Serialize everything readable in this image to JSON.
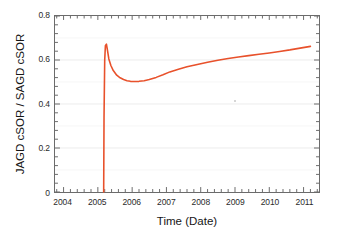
{
  "chart_data": {
    "type": "line",
    "title": "",
    "xlabel": "Time (Date)",
    "ylabel": "JAGD cSOR / SAGD cSOR",
    "xlim": [
      2003.75,
      2011.45
    ],
    "ylim": [
      0,
      0.8
    ],
    "grid": true,
    "legend": null,
    "line_color": "#e8512b",
    "axis_color": "#6b6b6b",
    "grid_color": "#ececec",
    "xticks": [
      2004,
      2005,
      2006,
      2007,
      2008,
      2009,
      2010,
      2011
    ],
    "xtick_labels": [
      "2004",
      "2005",
      "2006",
      "2007",
      "2008",
      "2009",
      "2010",
      "2011"
    ],
    "yticks": [
      0,
      0.2,
      0.4,
      0.6,
      0.8
    ],
    "ytick_labels": [
      "0",
      "0.2",
      "0.4",
      "0.6",
      "0.8"
    ],
    "x_minor_tick_interval": 0.2,
    "y_minor_tick_interval": 0.04,
    "series": [
      {
        "name": "JAGD cSOR / SAGD cSOR",
        "color": "#e8512b",
        "x": [
          2005.17,
          2005.18,
          2005.2,
          2005.22,
          2005.25,
          2005.28,
          2005.32,
          2005.38,
          2005.45,
          2005.55,
          2005.65,
          2005.75,
          2005.85,
          2005.95,
          2006.05,
          2006.2,
          2006.35,
          2006.5,
          2006.7,
          2006.9,
          2007.1,
          2007.35,
          2007.6,
          2007.9,
          2008.2,
          2008.5,
          2008.8,
          2009.1,
          2009.4,
          2009.7,
          2010.0,
          2010.3,
          2010.6,
          2010.9,
          2011.2
        ],
        "y": [
          0.0,
          0.34,
          0.6,
          0.665,
          0.672,
          0.645,
          0.605,
          0.575,
          0.552,
          0.531,
          0.519,
          0.511,
          0.506,
          0.503,
          0.502,
          0.503,
          0.506,
          0.511,
          0.521,
          0.533,
          0.546,
          0.558,
          0.569,
          0.58,
          0.59,
          0.599,
          0.607,
          0.614,
          0.62,
          0.626,
          0.632,
          0.639,
          0.646,
          0.654,
          0.662
        ]
      }
    ],
    "annotations": [
      {
        "name": "dust-speck",
        "x_px": 234,
        "y_px": 100
      }
    ]
  }
}
